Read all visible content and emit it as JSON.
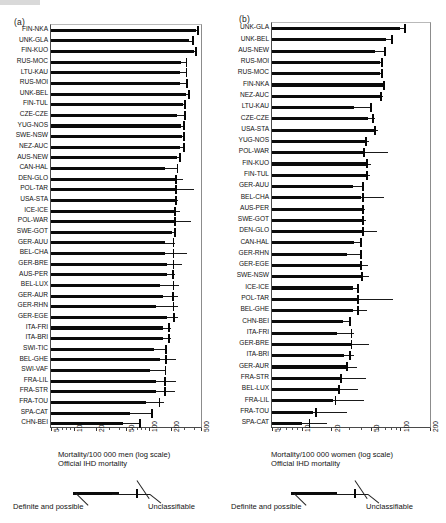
{
  "figure": {
    "panel_a_tag": "(a)",
    "panel_b_tag": "(b)"
  },
  "panel_a": {
    "axis_caption_line1": "Mortality/100 000 men (log scale)",
    "axis_caption_line2": "Official IHD mortality",
    "legend_left_label": "Definite and possible",
    "legend_right_label": "Unclassifiable"
  },
  "panel_b": {
    "axis_caption_line1": "Mortality/100 000 women (log scale)",
    "axis_caption_line2": "Official IHD mortality",
    "legend_left_label": "Definite and possible",
    "legend_right_label": "Unclassifiable"
  },
  "chart_data": [
    {
      "type": "bar",
      "orientation": "horizontal",
      "panel": "(a)",
      "title": "",
      "xlabel": "Mortality/100 000 men (log scale)",
      "ylabel": "",
      "xscale": "log",
      "xlim": [
        5,
        500
      ],
      "xticks": [
        5,
        10,
        20,
        50,
        100,
        200,
        500
      ],
      "xticklabels": [
        "5",
        "10",
        "20",
        "50",
        "100",
        "200",
        "500"
      ],
      "grid": false,
      "legend": [
        "Definite and possible",
        "Unclassifiable",
        "Official IHD mortality"
      ],
      "legend_position": "below-axis",
      "categories": [
        "FIN-NKA",
        "UNK-GLA",
        "FIN-KUO",
        "RUS-MOC",
        "LTU-KAU",
        "RUS-MOI",
        "UNK-BEL",
        "FIN-TUL",
        "CZE-CZE",
        "YUG-NOS",
        "SWE-NSW",
        "NEZ-AUC",
        "AUS-NEW",
        "CAN-HAL",
        "DEN-GLO",
        "POL-TAR",
        "USA-STA",
        "ICE-ICE",
        "POL-WAR",
        "SWE-GOT",
        "GER-AUU",
        "BEL-CHA",
        "GER-BRE",
        "AUS-PER",
        "BEL-LUX",
        "GER-AUR",
        "GER-RHN",
        "GER-EGE",
        "ITA-FRI",
        "ITA-BRI",
        "SWI-TIC",
        "BEL-GHE",
        "SWI-VAF",
        "FRA-LIL",
        "FRA-STR",
        "FRA-TOU",
        "SPA-CAT",
        "CHN-BEI"
      ],
      "series": [
        {
          "name": "Definite and possible",
          "values": [
            430,
            346,
            400,
            270,
            264,
            264,
            312,
            290,
            243,
            270,
            281,
            264,
            243,
            165,
            243,
            243,
            233,
            223,
            223,
            208,
            165,
            165,
            175,
            175,
            140,
            155,
            125,
            175,
            155,
            155,
            117,
            140,
            105,
            125,
            125,
            92,
            57,
            46
          ]
        },
        {
          "name": "Unclassifiable (extent of range)",
          "values": [
            460,
            395,
            435,
            330,
            320,
            325,
            350,
            310,
            315,
            310,
            300,
            305,
            270,
            250,
            285,
            400,
            250,
            265,
            370,
            235,
            225,
            330,
            275,
            225,
            255,
            245,
            245,
            245,
            200,
            200,
            175,
            230,
            165,
            230,
            225,
            160,
            113,
            78
          ]
        },
        {
          "name": "Official IHD mortality",
          "values": [
            455,
            390,
            430,
            320,
            320,
            322,
            345,
            305,
            310,
            300,
            295,
            298,
            262,
            243,
            235,
            235,
            230,
            225,
            225,
            228,
            215,
            215,
            215,
            212,
            215,
            210,
            215,
            218,
            187,
            187,
            172,
            170,
            168,
            165,
            165,
            140,
            112,
            76
          ]
        }
      ]
    },
    {
      "type": "bar",
      "orientation": "horizontal",
      "panel": "(b)",
      "title": "",
      "xlabel": "Mortality/100 000 women (log scale)",
      "ylabel": "",
      "xscale": "log",
      "xlim": [
        5,
        200
      ],
      "xticks": [
        5,
        10,
        20,
        50,
        100,
        200
      ],
      "xticklabels": [
        "5",
        "10",
        "20",
        "50",
        "100",
        "200"
      ],
      "grid": false,
      "legend": [
        "Definite and possible",
        "Unclassifiable",
        "Official IHD mortality"
      ],
      "legend_position": "below-axis",
      "categories": [
        "UNK-GLA",
        "UNK-BEL",
        "AUS-NEW",
        "RUS-MOI",
        "RUS-MOC",
        "FIN-NKA",
        "NEZ-AUC",
        "LTU-KAU",
        "CZE-CZE",
        "USA-STA",
        "YUG-NOS",
        "POL-WAR",
        "FIN-KUO",
        "FIN-TUL",
        "GER-AUU",
        "BEL-CHA",
        "AUS-PER",
        "SWE-GOT",
        "DEN-GLO",
        "CAN-HAL",
        "GER-RHN",
        "GER-EGE",
        "SWE-NSW",
        "ICE-ICE",
        "POL-TAR",
        "BEL-GHE",
        "CHN-BEI",
        "ITA-FRI",
        "GER-BRE",
        "ITA-BRI",
        "GER-AUR",
        "FRA-STR",
        "BEL-LUX",
        "FRA-LIL",
        "FRA-TOU",
        "SPA-CAT"
      ],
      "series": [
        {
          "name": "Definite and possible",
          "values": [
            100,
            72,
            55,
            62,
            62,
            68,
            62,
            34,
            47,
            55,
            45,
            42,
            47,
            47,
            33,
            40,
            41,
            42,
            41,
            34,
            29,
            39,
            42,
            33,
            36,
            33,
            26,
            23,
            32,
            27,
            28,
            25,
            24,
            21,
            13,
            10
          ]
        },
        {
          "name": "Unclassifiable (extent of range)",
          "values": [
            113,
            84,
            72,
            66,
            67,
            70,
            66,
            52,
            55,
            59,
            48,
            75,
            50,
            49,
            42,
            68,
            44,
            45,
            58,
            40,
            40,
            47,
            48,
            37,
            84,
            46,
            31,
            34,
            48,
            34,
            36,
            45,
            37,
            43,
            29,
            18
          ]
        },
        {
          "name": "Official IHD mortality",
          "values": [
            112,
            82,
            70,
            65,
            65,
            69,
            64,
            50,
            53,
            55,
            45,
            43,
            46,
            46,
            42,
            42,
            42,
            42,
            42,
            40,
            40,
            40,
            41,
            37,
            37,
            37,
            31,
            32,
            32,
            31,
            29,
            25,
            24,
            22,
            14,
            12
          ]
        }
      ]
    }
  ]
}
